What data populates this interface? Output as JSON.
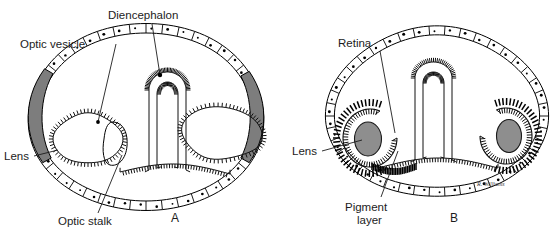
{
  "figure": {
    "background_color": "#ffffff",
    "ink_color": "#1c1c1c",
    "lens_fill_color": "#8e8e8e",
    "signature": "R. Williams"
  },
  "panels": [
    {
      "id": "A",
      "letter": "A",
      "description": "Transverse section of embryonic head at optic vesicle stage",
      "labels": [
        {
          "name": "optic-vesicle",
          "text": "Optic vesicle",
          "text_x": 20,
          "text_y": 48,
          "anchor": "start",
          "leader": "M 116 44 L 98 122"
        },
        {
          "name": "diencephalon",
          "text": "Diencephalon",
          "text_x": 108,
          "text_y": 19,
          "anchor": "start",
          "leader": "M 152 24 L 160 75"
        },
        {
          "name": "lens",
          "text": "Lens",
          "text_x": 4,
          "text_y": 160,
          "anchor": "start",
          "leader": "M 34 156 L 58 150"
        },
        {
          "name": "optic-stalk",
          "text": "Optic stalk",
          "text_x": 58,
          "text_y": 225,
          "anchor": "start",
          "leader": "M 98 213 L 122 155"
        }
      ],
      "letter_x": 171,
      "letter_y": 222
    },
    {
      "id": "B",
      "letter": "B",
      "description": "Transverse section of embryonic head at optic cup stage",
      "labels": [
        {
          "name": "retina",
          "text": "Retina",
          "text_x": 338,
          "text_y": 47,
          "anchor": "start",
          "leader": "M 380 51 L 395 133"
        },
        {
          "name": "lens",
          "text": "Lens",
          "text_x": 292,
          "text_y": 155,
          "anchor": "start",
          "leader": "M 322 151 L 362 140"
        },
        {
          "name": "pigment-layer",
          "text": "Pigment",
          "text_line2": "layer",
          "text_x": 345,
          "text_y": 211,
          "anchor": "start",
          "leader": "M 381 197 L 398 151"
        }
      ],
      "letter_x": 450,
      "letter_y": 222
    }
  ]
}
